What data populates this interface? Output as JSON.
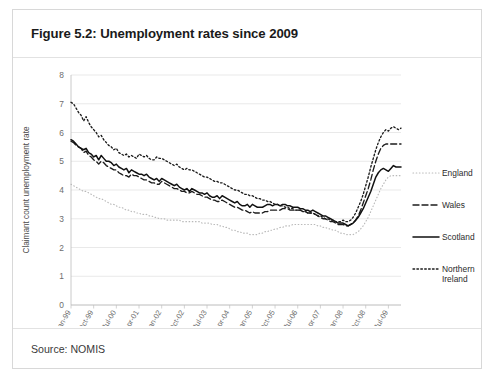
{
  "figure": {
    "title": "Figure 5.2: Unemployment rates since 2009",
    "source": "Source: NOMIS"
  },
  "chart_data": {
    "type": "line",
    "title": "Figure 5.2: Unemployment rates since 2009",
    "xlabel": "",
    "ylabel": "Claimant count unemployment rate",
    "ylim": [
      0,
      8
    ],
    "ytick_labels": [
      "0",
      "1",
      "2",
      "3",
      "4",
      "5",
      "6",
      "7",
      "8"
    ],
    "yticks": [
      0,
      1,
      2,
      3,
      4,
      5,
      6,
      7,
      8
    ],
    "grid": true,
    "legend_position": "right",
    "x_tick_labels": [
      "Jan-99",
      "Oct-99",
      "Jul-00",
      "Apr-01",
      "Jan-02",
      "Oct-02",
      "Jul-03",
      "Apr-04",
      "Jan-05",
      "Oct-05",
      "Jul-06",
      "Apr-07",
      "Jan-08",
      "Oct-08",
      "Jul-09"
    ],
    "x_tick_indices": [
      0,
      9,
      18,
      27,
      36,
      45,
      54,
      63,
      72,
      81,
      90,
      99,
      108,
      117,
      126
    ],
    "x_start": "Jan-99",
    "x_end": "Dec-09",
    "n_points": 132,
    "series": [
      {
        "name": "England",
        "style": "fine-dotted",
        "color": "#b9b9b9",
        "values": [
          4.2,
          4.15,
          4.1,
          4.05,
          4.0,
          3.95,
          3.95,
          3.9,
          3.85,
          3.8,
          3.75,
          3.7,
          3.7,
          3.65,
          3.6,
          3.55,
          3.5,
          3.5,
          3.45,
          3.4,
          3.4,
          3.35,
          3.3,
          3.3,
          3.25,
          3.25,
          3.2,
          3.2,
          3.15,
          3.15,
          3.15,
          3.1,
          3.1,
          3.05,
          3.05,
          3.0,
          3.0,
          3.0,
          2.95,
          2.95,
          2.95,
          2.95,
          2.95,
          2.95,
          2.9,
          2.9,
          2.9,
          2.9,
          2.9,
          2.9,
          2.9,
          2.9,
          2.85,
          2.85,
          2.85,
          2.85,
          2.8,
          2.8,
          2.8,
          2.75,
          2.75,
          2.7,
          2.7,
          2.65,
          2.6,
          2.6,
          2.55,
          2.55,
          2.5,
          2.5,
          2.5,
          2.45,
          2.45,
          2.45,
          2.45,
          2.5,
          2.5,
          2.55,
          2.55,
          2.6,
          2.6,
          2.65,
          2.65,
          2.7,
          2.7,
          2.75,
          2.75,
          2.75,
          2.8,
          2.8,
          2.8,
          2.8,
          2.8,
          2.8,
          2.8,
          2.8,
          2.8,
          2.8,
          2.75,
          2.75,
          2.7,
          2.7,
          2.65,
          2.65,
          2.6,
          2.6,
          2.55,
          2.5,
          2.5,
          2.45,
          2.45,
          2.45,
          2.45,
          2.5,
          2.55,
          2.65,
          2.75,
          2.9,
          3.05,
          3.25,
          3.45,
          3.65,
          3.85,
          4.05,
          4.2,
          4.35,
          4.45,
          4.5,
          4.5,
          4.5,
          4.5,
          4.5
        ],
        "start_value": 4.2,
        "min_value": 2.45,
        "end_value": 4.5
      },
      {
        "name": "Wales",
        "style": "dashed",
        "color": "#1c1c1c",
        "values": [
          5.7,
          5.65,
          5.55,
          5.5,
          5.45,
          5.3,
          5.35,
          5.2,
          5.15,
          5.05,
          5.0,
          4.9,
          5.0,
          4.95,
          4.85,
          4.8,
          4.75,
          4.7,
          4.7,
          4.6,
          4.55,
          4.5,
          4.5,
          4.45,
          4.55,
          4.5,
          4.5,
          4.45,
          4.4,
          4.35,
          4.35,
          4.3,
          4.25,
          4.25,
          4.2,
          4.2,
          4.3,
          4.25,
          4.2,
          4.15,
          4.1,
          4.05,
          4.05,
          4.0,
          3.95,
          3.95,
          3.9,
          3.9,
          3.95,
          3.9,
          3.85,
          3.85,
          3.8,
          3.75,
          3.75,
          3.7,
          3.65,
          3.65,
          3.6,
          3.6,
          3.65,
          3.6,
          3.55,
          3.5,
          3.45,
          3.4,
          3.4,
          3.35,
          3.3,
          3.3,
          3.25,
          3.2,
          3.25,
          3.2,
          3.2,
          3.2,
          3.2,
          3.25,
          3.25,
          3.3,
          3.3,
          3.3,
          3.3,
          3.3,
          3.35,
          3.35,
          3.35,
          3.3,
          3.3,
          3.3,
          3.3,
          3.3,
          3.25,
          3.25,
          3.2,
          3.2,
          3.2,
          3.15,
          3.1,
          3.05,
          3.0,
          3.0,
          2.95,
          2.9,
          2.9,
          2.85,
          2.8,
          2.8,
          2.8,
          2.75,
          2.75,
          2.8,
          2.85,
          2.95,
          3.1,
          3.3,
          3.55,
          3.8,
          4.05,
          4.35,
          4.7,
          5.0,
          5.25,
          5.45,
          5.55,
          5.6,
          5.6,
          5.6,
          5.6,
          5.6,
          5.6,
          5.6
        ],
        "start_value": 5.7,
        "min_value": 2.75,
        "end_value": 5.6
      },
      {
        "name": "Scotland",
        "style": "solid",
        "color": "#111111",
        "values": [
          5.75,
          5.7,
          5.6,
          5.5,
          5.45,
          5.4,
          5.45,
          5.3,
          5.25,
          5.15,
          5.2,
          5.05,
          5.2,
          5.1,
          5.0,
          5.0,
          4.95,
          4.85,
          4.9,
          4.8,
          4.75,
          4.7,
          4.75,
          4.6,
          4.7,
          4.65,
          4.6,
          4.55,
          4.55,
          4.5,
          4.55,
          4.45,
          4.4,
          4.35,
          4.4,
          4.3,
          4.4,
          4.35,
          4.3,
          4.25,
          4.2,
          4.15,
          4.2,
          4.1,
          4.05,
          4.0,
          4.05,
          3.95,
          4.05,
          4.0,
          3.95,
          3.9,
          3.9,
          3.85,
          3.9,
          3.8,
          3.75,
          3.75,
          3.8,
          3.7,
          3.8,
          3.75,
          3.7,
          3.65,
          3.6,
          3.55,
          3.6,
          3.5,
          3.45,
          3.45,
          3.5,
          3.4,
          3.5,
          3.45,
          3.4,
          3.4,
          3.4,
          3.45,
          3.5,
          3.5,
          3.45,
          3.5,
          3.5,
          3.45,
          3.5,
          3.5,
          3.45,
          3.45,
          3.4,
          3.4,
          3.4,
          3.35,
          3.35,
          3.3,
          3.3,
          3.25,
          3.3,
          3.25,
          3.2,
          3.15,
          3.1,
          3.1,
          3.05,
          3.0,
          2.95,
          2.9,
          2.85,
          2.85,
          2.85,
          2.8,
          2.75,
          2.8,
          2.85,
          2.95,
          3.05,
          3.2,
          3.35,
          3.55,
          3.75,
          3.95,
          4.2,
          4.45,
          4.6,
          4.7,
          4.75,
          4.7,
          4.65,
          4.75,
          4.85,
          4.8,
          4.8,
          4.8
        ],
        "start_value": 5.75,
        "min_value": 2.75,
        "end_value": 4.8
      },
      {
        "name": "Northern Ireland",
        "style": "dotted",
        "color": "#1c1c1c",
        "values": [
          7.05,
          7.0,
          6.85,
          6.7,
          6.6,
          6.4,
          6.55,
          6.35,
          6.2,
          6.1,
          6.0,
          5.85,
          5.9,
          5.75,
          5.65,
          5.55,
          5.5,
          5.4,
          5.45,
          5.3,
          5.25,
          5.2,
          5.25,
          5.15,
          5.2,
          5.15,
          5.1,
          5.25,
          5.2,
          5.15,
          5.2,
          5.1,
          5.05,
          5.05,
          5.15,
          5.1,
          5.1,
          5.05,
          5.0,
          4.95,
          4.9,
          4.85,
          4.9,
          4.8,
          4.75,
          4.7,
          4.75,
          4.7,
          4.7,
          4.65,
          4.6,
          4.55,
          4.5,
          4.45,
          4.45,
          4.4,
          4.35,
          4.3,
          4.3,
          4.25,
          4.25,
          4.2,
          4.15,
          4.1,
          4.05,
          4.0,
          4.0,
          3.95,
          3.9,
          3.85,
          3.85,
          3.8,
          3.8,
          3.75,
          3.7,
          3.7,
          3.65,
          3.65,
          3.6,
          3.6,
          3.55,
          3.5,
          3.5,
          3.45,
          3.45,
          3.4,
          3.4,
          3.35,
          3.35,
          3.3,
          3.3,
          3.3,
          3.25,
          3.25,
          3.2,
          3.2,
          3.2,
          3.15,
          3.1,
          3.1,
          3.05,
          3.0,
          3.0,
          2.95,
          2.95,
          2.9,
          2.9,
          2.9,
          2.95,
          2.9,
          2.9,
          2.95,
          3.05,
          3.2,
          3.4,
          3.6,
          3.85,
          4.15,
          4.45,
          4.8,
          5.1,
          5.4,
          5.65,
          5.85,
          6.0,
          6.1,
          6.05,
          6.15,
          6.2,
          6.15,
          6.1,
          6.15
        ],
        "start_value": 7.05,
        "min_value": 2.9,
        "end_value": 6.15
      }
    ]
  },
  "legend": {
    "items": [
      {
        "label": "England",
        "key": "england"
      },
      {
        "label": "Wales",
        "key": "wales"
      },
      {
        "label": "Scotland",
        "key": "scotland"
      },
      {
        "label": "Northern Ireland",
        "key": "nireland"
      }
    ]
  }
}
